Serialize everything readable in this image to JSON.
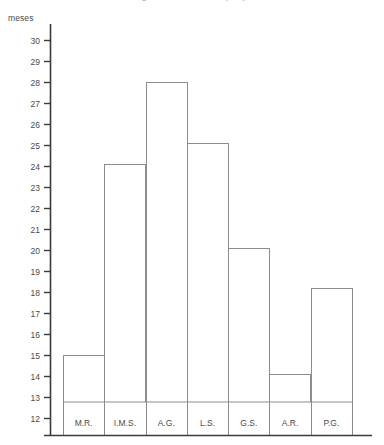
{
  "caption": {
    "text": "Figura 3. Distribución por paciente"
  },
  "chart_data": {
    "type": "bar",
    "title": "",
    "subtitle": "",
    "xlabel": "",
    "ylabel": "meses",
    "categories": [
      "M.R.",
      "I.M.S.",
      "A.G.",
      "L.S.",
      "G.S.",
      "A.R.",
      "P.G."
    ],
    "values": [
      15,
      24.1,
      28,
      25.1,
      20.1,
      14.1,
      18.2
    ],
    "series": [
      {
        "name": "meses",
        "values": [
          15,
          24.1,
          28,
          25.1,
          20.1,
          14.1,
          18.2
        ]
      }
    ],
    "ylim": [
      12,
      30
    ],
    "ytick_labels": [
      "30",
      "29",
      "28",
      "27",
      "26",
      "25",
      "24",
      "23",
      "22",
      "21",
      "20",
      "19",
      "18",
      "17",
      "16",
      "15",
      "14",
      "13",
      "12"
    ],
    "ytick_values": [
      30,
      29,
      28,
      27,
      26,
      25,
      24,
      23,
      22,
      21,
      20,
      19,
      18,
      17,
      16,
      15,
      14,
      13,
      12
    ],
    "grid": false,
    "legend": "none",
    "bar_fill": "#ffffff",
    "bar_stroke": "#8c8c8c",
    "axis_color": "#3b3b3b",
    "text_color": "#4a4a4a"
  }
}
